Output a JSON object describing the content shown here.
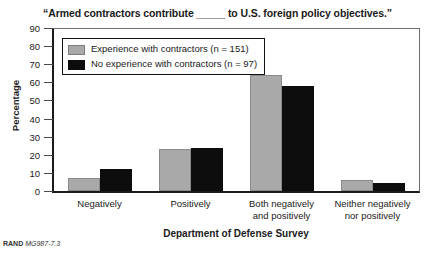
{
  "figure": {
    "id_prefix": "RAND",
    "id_number": "MG987-7.3"
  },
  "chart_data": {
    "type": "bar",
    "title": "“Armed contractors contribute _____ to U.S. foreign policy objectives.”",
    "xlabel": "Department of Defense Survey",
    "ylabel": "Percentage",
    "categories": [
      "Negatively",
      "Positively",
      "Both negatively\nand positively",
      "Neither negatively\nnor positively"
    ],
    "series": [
      {
        "name": "Experience with contractors (n = 151)",
        "color": "#a9a9a9",
        "values": [
          7,
          23,
          64,
          6
        ]
      },
      {
        "name": "No experience with contractors (n = 97)",
        "color": "#0d0d0d",
        "values": [
          12,
          24,
          58,
          4.5
        ]
      }
    ],
    "ylim": [
      0,
      90
    ],
    "yticks": [
      0,
      10,
      20,
      30,
      40,
      50,
      60,
      70,
      80,
      90
    ],
    "grid": false,
    "legend_position": "upper-left"
  }
}
